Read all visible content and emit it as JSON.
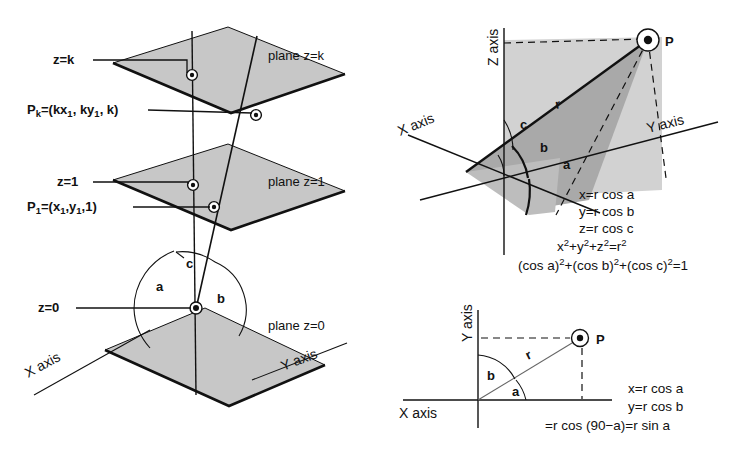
{
  "figure": {
    "background_color": "#ffffff",
    "ink_color": "#111111",
    "plane_fill_color": "#c7c7c7"
  },
  "left_diagram": {
    "name": "stacked-planes-direction-cosines",
    "labels": {
      "z_k": "z=k",
      "point_k_prefix": "P",
      "point_k_sub": "k",
      "point_k_body_1": "=(kx",
      "point_k_sub_1": "1",
      "point_k_body_2": ", ky",
      "point_k_sub_2": "1",
      "point_k_body_3": ", k)",
      "z_1": "z=1",
      "point_1_prefix": "P",
      "point_1_sub": "1",
      "point_1_body_1": "=(x",
      "point_1_sub_1": "1",
      "point_1_body_2": ",y",
      "point_1_sub_2": "1",
      "point_1_body_3": ",1)",
      "z_0": "z=0",
      "plane_z_k": "plane z=k",
      "plane_z_1": "plane z=1",
      "plane_z_0": "plane z=0",
      "x_axis": "X axis",
      "y_axis": "Y axis",
      "angle_a": "a",
      "angle_b": "b",
      "angle_c": "c"
    }
  },
  "top_right_diagram": {
    "name": "3d-direction-cosines",
    "labels": {
      "z_axis": "Z axis",
      "x_axis": "X axis",
      "y_axis": "Y axis",
      "point_p": "P",
      "radius": "r",
      "angle_a": "a",
      "angle_b": "b",
      "angle_c": "c"
    },
    "equations": [
      "x=r cos a",
      "y=r cos b",
      "z=r cos c"
    ],
    "equation_pyth": {
      "x": "x",
      "x_sup": "2",
      "plus1": "+y",
      "y_sup": "2",
      "plus2": "+z",
      "z_sup": "2",
      "eq": "=r",
      "r_sup": "2"
    },
    "equation_identity": {
      "part1": "(cos a)",
      "sup1": "2",
      "part2": "+(cos b)",
      "sup2": "2",
      "part3": "+(cos c)",
      "sup3": "2",
      "part4": "=1"
    }
  },
  "bottom_right_diagram": {
    "name": "2d-direction-cosines",
    "labels": {
      "y_axis": "Y axis",
      "x_axis": "X axis",
      "point_p": "P",
      "radius": "r",
      "angle_a": "a",
      "angle_b": "b"
    },
    "equations": [
      "x=r cos a",
      "y=r cos b",
      "=r cos (90−a)=r sin  a"
    ]
  }
}
